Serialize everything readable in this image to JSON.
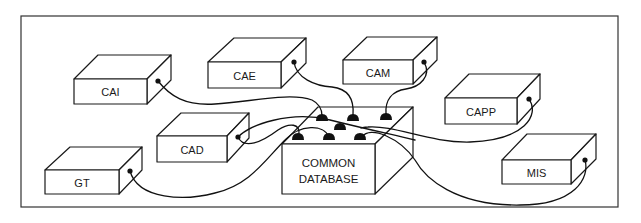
{
  "diagram": {
    "type": "hub-and-spoke",
    "colors": {
      "line": "#1a1a1a",
      "background": "#ffffff"
    },
    "hub": {
      "id": "db",
      "label_lines": [
        "COMMON",
        "DATABASE"
      ]
    },
    "nodes": [
      {
        "id": "cai",
        "label": "CAI"
      },
      {
        "id": "cae",
        "label": "CAE"
      },
      {
        "id": "cam",
        "label": "CAM"
      },
      {
        "id": "capp",
        "label": "CAPP"
      },
      {
        "id": "cad",
        "label": "CAD"
      },
      {
        "id": "gt",
        "label": "GT"
      },
      {
        "id": "mis",
        "label": "MIS"
      }
    ],
    "connections": [
      {
        "from": "cai",
        "to": "db"
      },
      {
        "from": "cae",
        "to": "db"
      },
      {
        "from": "cam",
        "to": "db"
      },
      {
        "from": "capp",
        "to": "db"
      },
      {
        "from": "cad",
        "to": "db"
      },
      {
        "from": "gt",
        "to": "db"
      },
      {
        "from": "mis",
        "to": "db"
      }
    ]
  }
}
